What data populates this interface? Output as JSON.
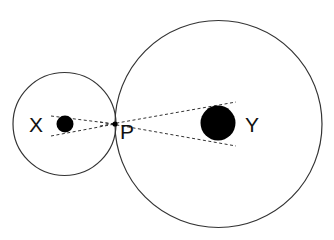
{
  "diagram": {
    "labels": {
      "x": "X",
      "p": "P",
      "y": "Y"
    },
    "colors": {
      "stroke": "#333333",
      "fill": "#000000",
      "background": "#ffffff"
    },
    "small_circle": {
      "cx": 64.5,
      "cy": 124,
      "r": 51.5
    },
    "large_circle": {
      "cx": 218.5,
      "cy": 124,
      "r": 103.5
    },
    "small_body": {
      "cx": 65,
      "cy": 124,
      "r": 8.5
    },
    "large_body": {
      "cx": 218,
      "cy": 123,
      "r": 17.5
    },
    "tangent_point": {
      "x": 115,
      "y": 124
    }
  }
}
